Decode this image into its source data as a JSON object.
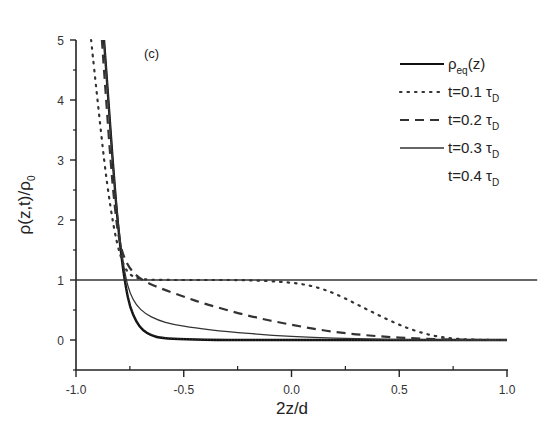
{
  "chart_data": {
    "type": "line",
    "panel_label": "(c)",
    "xlabel": "2z/d",
    "ylabel": "ρ(z,t)/ρ",
    "ylabel_sub": "0",
    "xlim": [
      -1.0,
      1.0
    ],
    "ylim": [
      -0.5,
      5
    ],
    "xticks": [
      -1.0,
      -0.5,
      0.0,
      0.5,
      1.0
    ],
    "xtick_labels": [
      "-1.0",
      "-0.5",
      "0.0",
      "0.5",
      "1.0"
    ],
    "yticks": [
      0,
      1,
      2,
      3,
      4,
      5
    ],
    "ytick_labels": [
      "0",
      "1",
      "2",
      "3",
      "4",
      "5"
    ],
    "grid": false,
    "legend_position": "upper right",
    "legend": [
      {
        "label_main": "ρ",
        "label_sub": "eq",
        "label_rest": "(z)",
        "style": "solid-thick"
      },
      {
        "label_main": "t=0.1 τ",
        "label_sub": "D",
        "label_rest": "",
        "style": "dotted"
      },
      {
        "label_main": "t=0.2 τ",
        "label_sub": "D",
        "label_rest": "",
        "style": "dashed"
      },
      {
        "label_main": "t=0.3 τ",
        "label_sub": "D",
        "label_rest": "",
        "style": "solid-thin"
      },
      {
        "label_main": "t=0.4 τ",
        "label_sub": "D",
        "label_rest": "",
        "style": "none"
      }
    ],
    "series": [
      {
        "name": "ρeq(z)",
        "style": "solid-thick",
        "x": [
          -0.87,
          -0.85,
          -0.83,
          -0.81,
          -0.79,
          -0.77,
          -0.75,
          -0.72,
          -0.69,
          -0.65,
          -0.6,
          -0.5,
          -0.3,
          0.0,
          0.5,
          1.0
        ],
        "y": [
          5.0,
          4.0,
          3.0,
          2.1,
          1.4,
          0.9,
          0.55,
          0.3,
          0.16,
          0.07,
          0.03,
          0.01,
          0.0,
          0.0,
          0.0,
          0.0
        ]
      },
      {
        "name": "t=0.1 τD",
        "style": "dotted",
        "x": [
          -0.93,
          -0.9,
          -0.87,
          -0.84,
          -0.81,
          -0.78,
          -0.75,
          -0.7,
          -0.6,
          -0.4,
          -0.2,
          0.0,
          0.1,
          0.2,
          0.3,
          0.4,
          0.5,
          0.6,
          0.7,
          0.8,
          0.9,
          1.0
        ],
        "y": [
          5.0,
          4.0,
          3.0,
          2.2,
          1.6,
          1.25,
          1.08,
          1.01,
          1.0,
          1.0,
          1.0,
          0.96,
          0.9,
          0.78,
          0.6,
          0.42,
          0.25,
          0.12,
          0.04,
          0.01,
          0.0,
          0.0
        ]
      },
      {
        "name": "t=0.2 τD",
        "style": "dashed",
        "x": [
          -0.88,
          -0.86,
          -0.84,
          -0.82,
          -0.8,
          -0.77,
          -0.73,
          -0.68,
          -0.6,
          -0.5,
          -0.4,
          -0.2,
          0.0,
          0.2,
          0.4,
          0.6,
          0.8,
          1.0
        ],
        "y": [
          5.0,
          4.0,
          3.0,
          2.2,
          1.65,
          1.3,
          1.1,
          0.97,
          0.85,
          0.72,
          0.6,
          0.4,
          0.25,
          0.13,
          0.06,
          0.02,
          0.0,
          0.0
        ]
      },
      {
        "name": "t=0.3 τD",
        "style": "solid-thin",
        "x": [
          -0.87,
          -0.85,
          -0.83,
          -0.81,
          -0.79,
          -0.77,
          -0.75,
          -0.72,
          -0.68,
          -0.62,
          -0.55,
          -0.45,
          -0.3,
          -0.1,
          0.1,
          0.3,
          0.6,
          1.0
        ],
        "y": [
          5.0,
          4.0,
          3.0,
          2.15,
          1.5,
          1.05,
          0.78,
          0.58,
          0.44,
          0.33,
          0.26,
          0.2,
          0.14,
          0.08,
          0.04,
          0.02,
          0.0,
          0.0
        ]
      },
      {
        "name": "t=0.4 τD",
        "style": "none",
        "x": [
          -0.87,
          -0.85,
          -0.83,
          -0.81,
          -0.79,
          -0.77,
          -0.75,
          -0.72,
          -0.69,
          -0.65,
          -0.6,
          -0.5,
          -0.3,
          0.0,
          0.5,
          1.0
        ],
        "y": [
          5.0,
          4.0,
          3.0,
          2.1,
          1.4,
          0.92,
          0.57,
          0.32,
          0.18,
          0.09,
          0.04,
          0.015,
          0.0,
          0.0,
          0.0,
          0.0
        ]
      },
      {
        "name": "reference ρ/ρ0 = 1",
        "style": "solid-thin",
        "x": [
          -1.0,
          1.14
        ],
        "y": [
          1.0,
          1.0
        ]
      }
    ]
  }
}
